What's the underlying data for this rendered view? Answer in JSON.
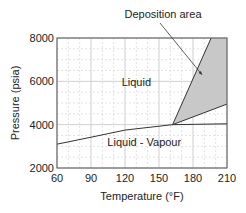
{
  "chart_data": {
    "type": "line",
    "title": "",
    "xlabel": "Temperature (°F)",
    "ylabel": "Pressure (psia)",
    "xlim": [
      60,
      210
    ],
    "ylim": [
      2000,
      8000
    ],
    "xticks": [
      60,
      90,
      120,
      150,
      180,
      210
    ],
    "yticks": [
      2000,
      4000,
      6000,
      8000
    ],
    "xtick_labels": [
      "60",
      "90",
      "120",
      "150",
      "180",
      "210"
    ],
    "ytick_labels": [
      "2000",
      "4000",
      "6000",
      "8000"
    ],
    "grid": true,
    "series": [
      {
        "name": "Bubble-point line",
        "x": [
          60,
          90,
          120,
          162
        ],
        "y": [
          3100,
          3420,
          3750,
          4000
        ]
      },
      {
        "name": "Lower boundary",
        "x": [
          162,
          210
        ],
        "y": [
          4000,
          4040
        ]
      },
      {
        "name": "Deposition upper boundary",
        "x": [
          162,
          196
        ],
        "y": [
          4000,
          8000
        ]
      },
      {
        "name": "Deposition lower boundary",
        "x": [
          162,
          210
        ],
        "y": [
          4000,
          4950
        ]
      }
    ],
    "shaded_region": {
      "name": "Deposition area",
      "x": [
        162,
        196,
        210,
        210
      ],
      "y": [
        4000,
        8000,
        8000,
        4950
      ],
      "color": "#c8c8c8"
    },
    "region_labels": [
      {
        "text": "Liquid",
        "x": 130,
        "y": 5800
      },
      {
        "text": "Liquid - Vapour",
        "x": 137,
        "y": 3000
      }
    ],
    "annotations": [
      {
        "text": "Deposition area",
        "arrow_to": {
          "x": 188,
          "y": 6300
        }
      }
    ]
  }
}
